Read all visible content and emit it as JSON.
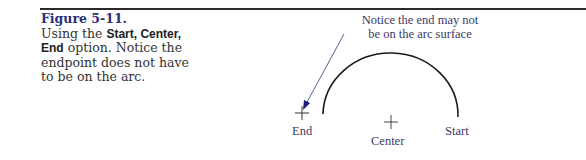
{
  "figure": {
    "number": "Figure 5-11.",
    "caption_parts": {
      "pre": "Using the ",
      "option_bold": "Start, Center, End",
      "post": " option. Notice the endpoint does not have to be on the arc."
    }
  },
  "diagram": {
    "note_line1": "Notice the end may not",
    "note_line2": "be on the arc surface",
    "labels": {
      "end": "End",
      "center": "Center",
      "start": "Start"
    },
    "colors": {
      "arc": "#1a1a1a",
      "leader": "#3a3a8a",
      "arrowhead": "#1a1a7a",
      "text": "#3a3a66"
    }
  }
}
